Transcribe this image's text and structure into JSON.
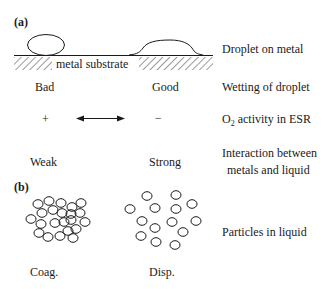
{
  "panel_a": {
    "label": "(a)",
    "substrate_label": "metal substrate",
    "rows": [
      {
        "left": "",
        "right": "",
        "description": "Droplet on metal"
      },
      {
        "left": "Bad",
        "right": "Good",
        "description": "Wetting of droplet"
      },
      {
        "left": "+",
        "right": "−",
        "description_prefix": "O",
        "description_sub": "2",
        "description_suffix": " activity in ESR",
        "arrow": "double-headed"
      },
      {
        "left": "Weak",
        "right": "Strong",
        "description_line1": "Interaction between",
        "description_line2": "metals and liquid"
      }
    ]
  },
  "panel_b": {
    "label": "(b)",
    "left_caption": "Coag.",
    "right_caption": "Disp.",
    "description": "Particles in liquid"
  },
  "colors": {
    "stroke": "#1a1a1a",
    "hatch": "#555555",
    "background": "#ffffff"
  }
}
